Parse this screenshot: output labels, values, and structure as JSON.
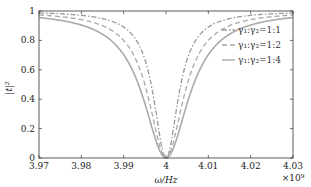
{
  "chart_data": {
    "type": "line",
    "title": "",
    "xlabel": "ω/Hz",
    "ylabel": "|t|²",
    "x_multiplier": "×10⁹",
    "xlim": [
      3.97,
      4.03
    ],
    "ylim": [
      0,
      1
    ],
    "x_ticks": [
      "3.97",
      "3.98",
      "3.99",
      "4",
      "4.01",
      "4.02",
      "4.03"
    ],
    "y_ticks": [
      "0",
      "0.2",
      "0.4",
      "0.6",
      "0.8",
      "1"
    ],
    "grid": false,
    "legend_position": "upper right",
    "series": [
      {
        "name": "γ₁:γ₂=1:1",
        "style": "dash-dot",
        "color": "#999999",
        "center": 4.0,
        "halfwidth": 0.0035,
        "min": 0.0
      },
      {
        "name": "γ₁:γ₂=1:2",
        "style": "dashed",
        "color": "#a8a8a8",
        "center": 4.0,
        "halfwidth": 0.005,
        "min": 0.0
      },
      {
        "name": "γ₁:γ₂=1:4",
        "style": "solid",
        "color": "#aaaaaa",
        "center": 4.0,
        "halfwidth": 0.0065,
        "min": 0.0
      }
    ],
    "x": [
      3.97,
      3.975,
      3.98,
      3.985,
      3.99,
      3.993,
      3.995,
      3.997,
      3.998,
      3.999,
      4.0,
      4.001,
      4.002,
      4.003,
      4.005,
      4.007,
      4.01,
      4.015,
      4.02,
      4.025,
      4.03
    ]
  },
  "labels": {
    "xlabel": "ω/Hz",
    "ylabel": "|t|²",
    "multiplier": "×10⁹",
    "legend": [
      "γ₁:γ₂=1:1",
      "γ₁:γ₂=1:2",
      "γ₁:γ₂=1:4"
    ]
  }
}
